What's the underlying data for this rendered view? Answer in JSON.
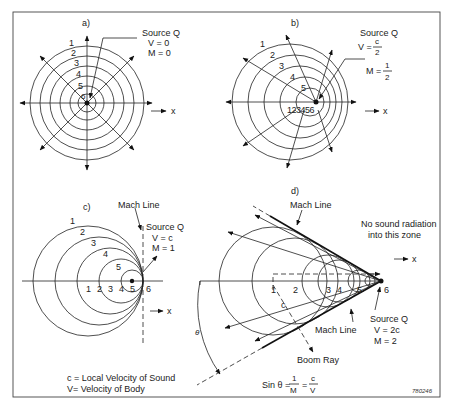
{
  "figure_id": "780246",
  "panels": {
    "a": {
      "label": "a)",
      "source_title": "Source Q",
      "velocity": "V = 0",
      "mach": "M = 0",
      "wave_numbers": [
        "1",
        "2",
        "3",
        "4",
        "5",
        "6"
      ],
      "axis_label": "x"
    },
    "b": {
      "label": "b)",
      "source_title": "Source Q",
      "velocity_prefix": "V =",
      "velocity_num": "c",
      "velocity_den": "2",
      "mach_prefix": "M =",
      "mach_num": "1",
      "mach_den": "2",
      "wave_numbers": [
        "1",
        "2",
        "3",
        "4",
        "5"
      ],
      "positions": "123456",
      "axis_label": "x"
    },
    "c": {
      "label": "c)",
      "mach_line_label": "Mach Line",
      "source_title": "Source Q",
      "velocity": "V = c",
      "mach": "M = 1",
      "wave_numbers": [
        "1",
        "2",
        "3",
        "4",
        "5"
      ],
      "positions": [
        "1",
        "2",
        "3",
        "4",
        "5",
        "6"
      ],
      "axis_label": "x",
      "legend_c": "c = Local Velocity of Sound",
      "legend_v": "V= Velocity of Body"
    },
    "d": {
      "label": "d)",
      "mach_line_top": "Mach Line",
      "mach_line_bottom": "Mach Line",
      "no_radiation_1": "No sound radiation",
      "no_radiation_2": "into this zone",
      "positions": [
        "1",
        "2",
        "3",
        "4",
        "5",
        "6"
      ],
      "c_label": "c",
      "theta": "θ",
      "boom_ray": "Boom Ray",
      "source_title": "Source Q",
      "velocity": "V = 2c",
      "mach": "M = 2",
      "axis_label": "x",
      "formula_prefix": "Sin θ =",
      "formula_num1": "1",
      "formula_den1": "M",
      "formula_eq": "=",
      "formula_num2": "c",
      "formula_den2": "V"
    }
  }
}
